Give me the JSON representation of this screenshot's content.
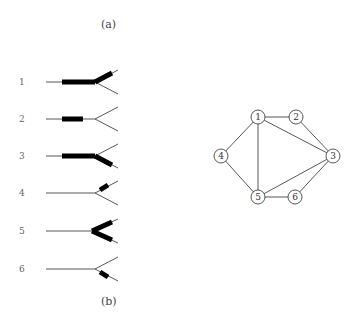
{
  "captions": {
    "a": "(a)",
    "b": "(b)"
  },
  "branch_rows": [
    {
      "label": "1",
      "thick_segments": [
        "stem-full",
        "upper-branch"
      ]
    },
    {
      "label": "2",
      "thick_segments": [
        "stem-partial"
      ]
    },
    {
      "label": "3",
      "thick_segments": [
        "stem-full",
        "lower-branch"
      ]
    },
    {
      "label": "4",
      "thick_segments": [
        "upper-branch-short"
      ]
    },
    {
      "label": "5",
      "thick_segments": [
        "upper-branch",
        "lower-branch"
      ]
    },
    {
      "label": "6",
      "thick_segments": [
        "lower-branch-short"
      ]
    }
  ],
  "graph": {
    "nodes": [
      "1",
      "2",
      "3",
      "4",
      "5",
      "6"
    ],
    "edges": [
      [
        "1",
        "2"
      ],
      [
        "1",
        "4"
      ],
      [
        "1",
        "5"
      ],
      [
        "1",
        "3"
      ],
      [
        "2",
        "3"
      ],
      [
        "4",
        "5"
      ],
      [
        "5",
        "3"
      ],
      [
        "5",
        "6"
      ],
      [
        "6",
        "3"
      ]
    ]
  }
}
